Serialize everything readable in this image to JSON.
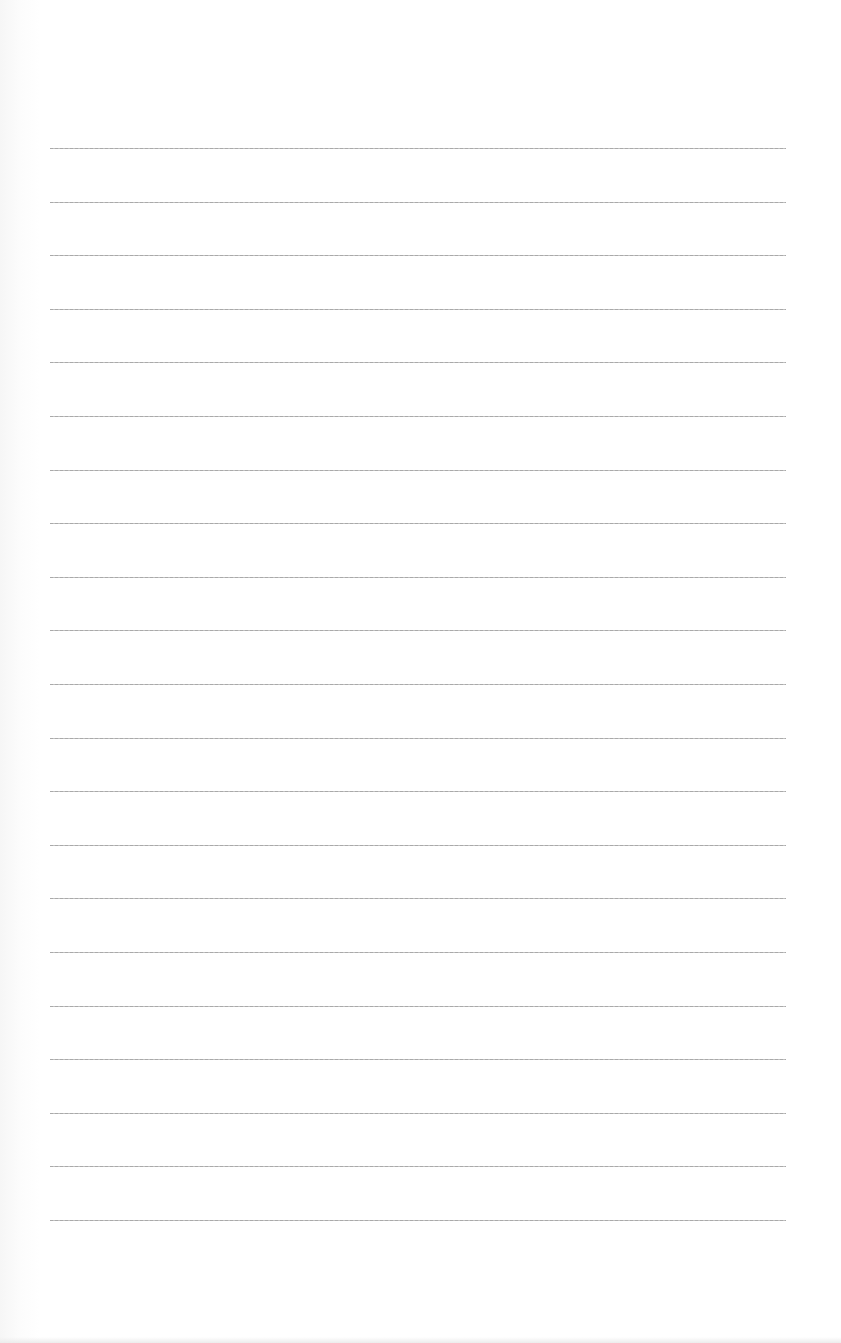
{
  "page": {
    "type": "lined-paper",
    "background_color": "#ffffff",
    "line_color": "#a0a0a0",
    "line_left_x": 50,
    "line_right_x": 786,
    "first_line_y": 148,
    "line_spacing": 53.6,
    "line_count": 21
  }
}
